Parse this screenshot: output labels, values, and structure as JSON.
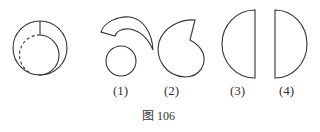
{
  "figure": {
    "caption": "图 106",
    "original_shape": {
      "description": "circle with inner circle (partly dashed) and radial cut line"
    },
    "options": [
      {
        "label": "(1)",
        "description": "crescent arc piece above a small circle"
      },
      {
        "label": "(2)",
        "description": "snail-like curled shape with notch"
      },
      {
        "label": "(3)",
        "description": "half disc, flat side right"
      },
      {
        "label": "(4)",
        "description": "half disc, flat side left"
      }
    ]
  }
}
